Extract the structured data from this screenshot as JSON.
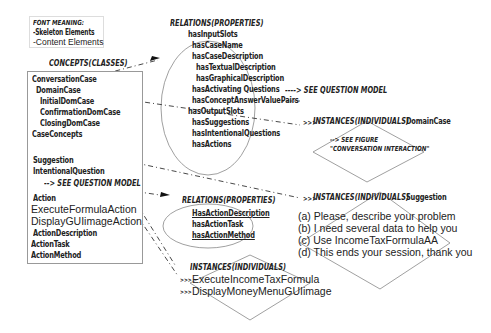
{
  "legend": {
    "title": "FONT MEANING:",
    "skeleton": "-Skeleton Elements",
    "content": "-Content Elements"
  },
  "concepts": {
    "heading": "CONCEPTS(CLASSES)",
    "items": [
      "ConversationCase",
      "DomainCase",
      "InitialDomCase",
      "ConfirmationDomCase",
      "ClosingDomCase",
      "CaseConcepts",
      "Suggestion",
      "IntentionalQuestion",
      "Action",
      "ExecuteFormulaAction",
      "DisplayGUIimageAction",
      "ActionDescription",
      "ActionTask",
      "ActionMethod"
    ],
    "see_question_model": "--> SEE QUESTION MODEL"
  },
  "relations_case": {
    "heading": "RELATIONS(PROPERTIES)",
    "items": [
      "hasInputSlots",
      "hasCaseName",
      "hasCaseDescription",
      "hasTextualDescription",
      "hasGraphicalDescription",
      "hasActivating Questions",
      "hasConceptAnswerValuePairs",
      "hasOutputSlots",
      "hasSuggestions",
      "hasIntentionalQuestions",
      "hasActions"
    ],
    "see_question_model": "----> SEE QUESTION MODEL"
  },
  "instances_domain": {
    "heading": "INSTANCES(INDIVIDUALS)",
    "label": "DomainCase",
    "note_line1": "--> SEE FIGURE",
    "note_line2": "\"CONVERSATION INTERACTION\""
  },
  "instances_suggestion": {
    "heading": "INSTANCES(INDIVIDUALS)",
    "label": "Suggestion",
    "items": [
      "(a) Please, describe your problem",
      "(b) I need several data to help you",
      "(c) Use IncomeTaxFormulaAA",
      "(d) This ends your session, thank you"
    ]
  },
  "relations_action": {
    "heading": "RELATIONS(PROPERTIES)",
    "items": [
      "HasActionDescription",
      "hasActionTask",
      "hasActionMethod"
    ]
  },
  "instances_action": {
    "heading": "INSTANCES(INDIVIDUALS)",
    "items": [
      "ExecuteIncomeTaxFormula",
      "DisplayMoneyMenuGUIimage"
    ]
  },
  "arrows": {
    "triple": ">>>"
  }
}
